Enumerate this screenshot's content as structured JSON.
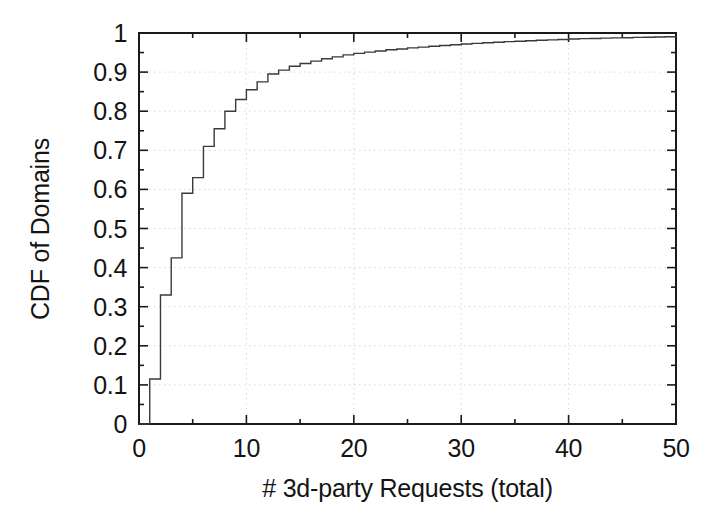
{
  "chart_data": {
    "type": "line",
    "subtype": "step-cdf",
    "title": "",
    "xlabel": "# 3d-party Requests (total)",
    "ylabel": "CDF of Domains",
    "xlim": [
      0,
      50
    ],
    "ylim": [
      0,
      1
    ],
    "xticks": [
      0,
      10,
      20,
      30,
      40,
      50
    ],
    "xtick_labels": [
      "0",
      "10",
      "20",
      "30",
      "40",
      "50"
    ],
    "yticks": [
      0,
      0.1,
      0.2,
      0.3,
      0.4,
      0.5,
      0.6,
      0.7,
      0.8,
      0.9,
      1
    ],
    "ytick_labels": [
      "0",
      "0.1",
      "0.2",
      "0.3",
      "0.4",
      "0.5",
      "0.6",
      "0.7",
      "0.8",
      "0.9",
      "1"
    ],
    "minor_tick_step_y": 0.05,
    "minor_tick_step_x": 2.5,
    "grid": true,
    "grid_style": "dotted",
    "grid_color": "#d8d8d8",
    "legend": null,
    "line_color": "#3a3a3a",
    "line_width": 1.4,
    "background": "#ffffff",
    "axis_color": "#1a1a1a",
    "series": [
      {
        "name": "CDF of Domains",
        "x": [
          0,
          1,
          2,
          3,
          4,
          5,
          6,
          7,
          8,
          9,
          10,
          11,
          12,
          13,
          14,
          15,
          16,
          17,
          18,
          19,
          20,
          21,
          22,
          23,
          24,
          25,
          26,
          27,
          28,
          29,
          30,
          31,
          32,
          33,
          34,
          35,
          36,
          37,
          38,
          39,
          40,
          41,
          42,
          43,
          44,
          45,
          46,
          47,
          48,
          49,
          50
        ],
        "values": [
          0.0,
          0.115,
          0.33,
          0.425,
          0.59,
          0.63,
          0.71,
          0.755,
          0.8,
          0.83,
          0.855,
          0.875,
          0.895,
          0.905,
          0.915,
          0.922,
          0.928,
          0.934,
          0.939,
          0.944,
          0.948,
          0.951,
          0.954,
          0.957,
          0.959,
          0.962,
          0.964,
          0.966,
          0.968,
          0.97,
          0.972,
          0.9735,
          0.975,
          0.9765,
          0.978,
          0.979,
          0.98,
          0.9815,
          0.9825,
          0.9835,
          0.9845,
          0.9855,
          0.986,
          0.9868,
          0.9875,
          0.988,
          0.9888,
          0.9893,
          0.9898,
          0.9903,
          0.991
        ]
      }
    ]
  }
}
